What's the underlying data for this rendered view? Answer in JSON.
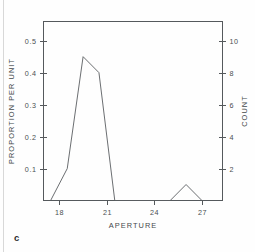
{
  "figure": {
    "panel_label": "c",
    "background_color": "#fefefe",
    "line_color": "#5a5e61",
    "axis_color": "#55595c",
    "text_color": "#45494b"
  },
  "chart_data": {
    "type": "line",
    "title": "",
    "subtitle": "",
    "xlabel": "APERTURE",
    "ylabel": "PROPORTION PER UNIT",
    "y2label": "COUNT",
    "xlim": [
      17.0,
      28.3
    ],
    "ylim": [
      0.0,
      0.56
    ],
    "y2lim": [
      0.0,
      11.2
    ],
    "grid": false,
    "legend": null,
    "xticks": [
      18,
      21,
      24,
      27
    ],
    "xticklabels": [
      "18",
      "21",
      "24",
      "27"
    ],
    "yticks": [
      0.1,
      0.2,
      0.3,
      0.4,
      0.5
    ],
    "yticklabels": [
      "0.1",
      "0.2",
      "0.3",
      "0.4",
      "0.5"
    ],
    "y2ticks": [
      2,
      4,
      6,
      8,
      10
    ],
    "y2ticklabels": [
      "2",
      "4",
      "6",
      "8",
      "10"
    ],
    "count_per_proportion": 20,
    "series": [
      {
        "name": "aperture frequency polygon",
        "x": [
          17.45,
          18.5,
          19.5,
          20.5,
          21.5,
          25.0,
          26.0,
          27.0
        ],
        "y": [
          0.0,
          0.1,
          0.45,
          0.4,
          0.0,
          0.0,
          0.05,
          0.0
        ],
        "counts": [
          0,
          2,
          9,
          8,
          0,
          0,
          1,
          0
        ]
      }
    ],
    "annotations": []
  }
}
